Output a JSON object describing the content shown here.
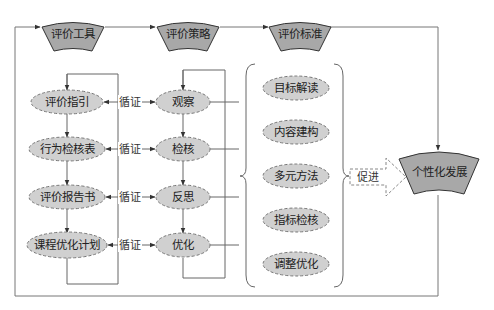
{
  "diagram": {
    "headers": [
      {
        "id": "tools",
        "label": "评价工具"
      },
      {
        "id": "strategy",
        "label": "评价策略"
      },
      {
        "id": "standard",
        "label": "评价标准"
      }
    ],
    "outcome": {
      "label": "个性化发展"
    },
    "tools_column": [
      {
        "label": "评价指引"
      },
      {
        "label": "行为检核表"
      },
      {
        "label": "评价报告书"
      },
      {
        "label": "课程优化计划"
      }
    ],
    "strategy_column": [
      {
        "label": "观察"
      },
      {
        "label": "检核"
      },
      {
        "label": "反思"
      },
      {
        "label": "优化"
      }
    ],
    "link_label": "循证",
    "standards_column": [
      {
        "label": "目标解读"
      },
      {
        "label": "内容建构"
      },
      {
        "label": "多元方法"
      },
      {
        "label": "指标检核"
      },
      {
        "label": "调整优化"
      }
    ],
    "promote_arrow": {
      "label": "促进"
    },
    "colors": {
      "fan_fill": "#a8a8a8",
      "ellipse_fill": "#d0d0d0",
      "line": "#666666",
      "dashed_border": "#7a7a7a"
    }
  }
}
